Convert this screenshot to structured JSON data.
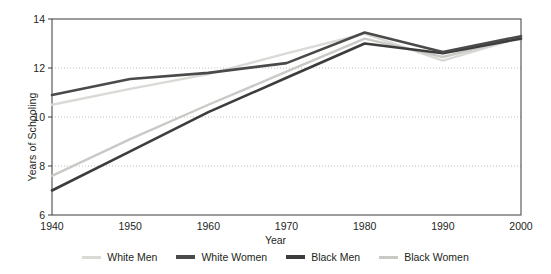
{
  "chart_data": {
    "type": "line",
    "title": "",
    "xlabel": "Year",
    "ylabel": "Years of Schooling",
    "x": [
      1940,
      1950,
      1960,
      1970,
      1980,
      1990,
      2000
    ],
    "xlim": [
      1940,
      2000
    ],
    "ylim": [
      6,
      14
    ],
    "xticks": [
      "1940",
      "1950",
      "1960",
      "1970",
      "1980",
      "1990",
      "2000"
    ],
    "yticks": [
      "6",
      "8",
      "10",
      "12",
      "14"
    ],
    "grid": "horizontal-dotted",
    "legend_position": "bottom",
    "series": [
      {
        "name": "White Men",
        "color": "#d9dad6",
        "values": [
          10.5,
          11.15,
          11.75,
          12.6,
          13.4,
          12.3,
          13.25
        ]
      },
      {
        "name": "White Women",
        "color": "#4a4a4a",
        "values": [
          10.9,
          11.55,
          11.8,
          12.2,
          13.45,
          12.65,
          13.3
        ]
      },
      {
        "name": "Black Men",
        "color": "#3c3c3c",
        "values": [
          7.0,
          8.6,
          10.2,
          11.6,
          13.0,
          12.6,
          13.2
        ]
      },
      {
        "name": "Black Women",
        "color": "#c9cac6",
        "values": [
          7.6,
          9.1,
          10.5,
          11.85,
          13.2,
          12.45,
          13.25
        ]
      }
    ]
  },
  "legend": {
    "items": [
      {
        "label": "White Men",
        "color": "#d9dad6",
        "thickness": 3
      },
      {
        "label": "White Women",
        "color": "#4a4a4a",
        "thickness": 3.4
      },
      {
        "label": "Black Men",
        "color": "#3c3c3c",
        "thickness": 3.4
      },
      {
        "label": "Black Women",
        "color": "#c9cac6",
        "thickness": 3
      }
    ]
  },
  "axes": {
    "x_title": "Year",
    "y_title": "Years of Schooling"
  },
  "style": {
    "frame_color": "#4d4d4d",
    "grid_color": "#b0b0b0",
    "background": "#ffffff"
  }
}
